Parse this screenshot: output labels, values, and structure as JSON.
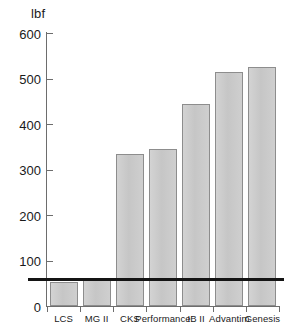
{
  "chart_data": {
    "type": "bar",
    "title": "",
    "subtitle": "",
    "xlabel": "",
    "ylabel": "lbf",
    "unit_label": "lbf",
    "categories": [
      "LCS",
      "MG II",
      "CKS",
      "Performance",
      "IB II",
      "Advantim",
      "Genesis"
    ],
    "values": [
      52,
      62,
      334,
      345,
      445,
      515,
      525
    ],
    "ylim": [
      0,
      600
    ],
    "ytick_labels": [
      "0",
      "100",
      "200",
      "300",
      "400",
      "500",
      "600"
    ],
    "yticks": [
      0,
      100,
      200,
      300,
      400,
      500,
      600
    ],
    "ytick_interval": 100,
    "grid": false,
    "legend": false,
    "legend_position": "none",
    "annotations": [
      {
        "name": "threshold-line",
        "type": "horizontal-reference-line",
        "value": 60,
        "label": ""
      }
    ],
    "colors": {
      "bar_fill": "#cacaca",
      "bar_edge": "#8d8d8d",
      "axis": "#6d6d6d",
      "threshold_line": "#141414",
      "text": "#1a1a1a",
      "background": "#ffffff"
    }
  }
}
